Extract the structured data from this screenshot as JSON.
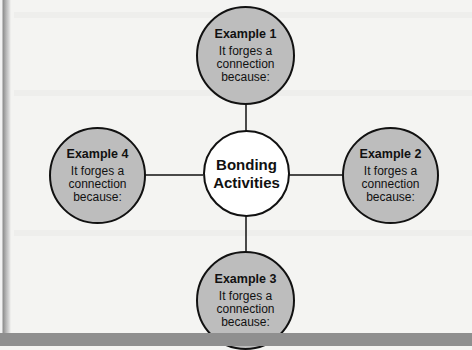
{
  "diagram": {
    "type": "hub-and-spoke",
    "center": {
      "line1": "Bonding",
      "line2": "Activities"
    },
    "examples": [
      {
        "id": 1,
        "title": "Example 1",
        "line1": "It forges a",
        "line2": "connection",
        "line3": "because:",
        "position": "top"
      },
      {
        "id": 2,
        "title": "Example 2",
        "line1": "It forges a",
        "line2": "connection",
        "line3": "because:",
        "position": "right"
      },
      {
        "id": 3,
        "title": "Example 3",
        "line1": "It forges a",
        "line2": "connection",
        "line3": "because:",
        "position": "bottom"
      },
      {
        "id": 4,
        "title": "Example 4",
        "line1": "It forges a",
        "line2": "connection",
        "line3": "because:",
        "position": "left"
      }
    ],
    "colors": {
      "example_fill": "#bdbdbd",
      "center_fill": "#ffffff",
      "stroke": "#111111",
      "background": "#f4f4f2",
      "band": "#8f8f8f"
    }
  }
}
